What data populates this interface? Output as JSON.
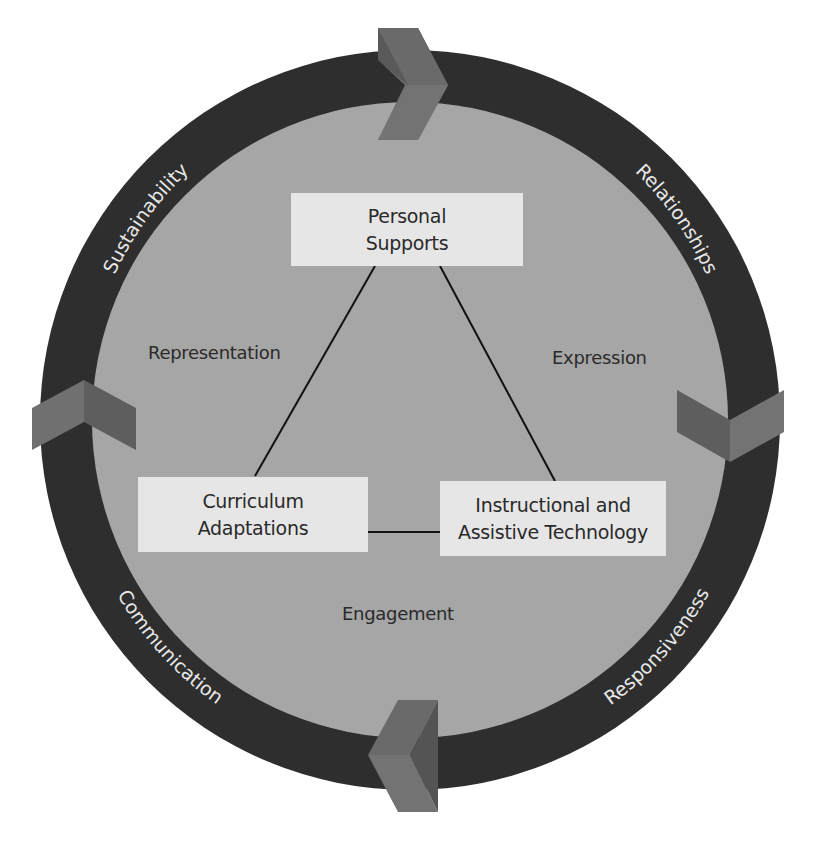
{
  "diagram": {
    "colors": {
      "ring": "#2e2e2e",
      "inner_circle": "#a6a6a6",
      "arrow_light": "#707070",
      "arrow_dark": "#595959",
      "box_fill": "#e6e6e6",
      "line": "#111111",
      "ring_text": "#e8e8e8",
      "inner_text": "#2a2a2a"
    },
    "ring_labels": {
      "top_left": "Sustainability",
      "top_right": "Relationships",
      "bottom_left": "Communication",
      "bottom_right": "Responsiveness"
    },
    "boxes": {
      "top": {
        "line1": "Personal",
        "line2": "Supports"
      },
      "bottom_left": {
        "line1": "Curriculum",
        "line2": "Adaptations"
      },
      "bottom_right": {
        "line1": "Instructional and",
        "line2": "Assistive Technology"
      }
    },
    "inner_labels": {
      "left": "Representation",
      "right": "Expression",
      "bottom": "Engagement"
    },
    "arrows": [
      {
        "position": "top",
        "direction": "right-pointing-chevron"
      },
      {
        "position": "right",
        "direction": "down-pointing-chevron"
      },
      {
        "position": "bottom",
        "direction": "left-pointing-chevron"
      },
      {
        "position": "left",
        "direction": "up-pointing-chevron"
      }
    ]
  }
}
